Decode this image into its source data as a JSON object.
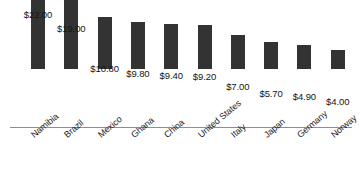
{
  "chart_data": {
    "type": "bar",
    "title": "",
    "xlabel": "",
    "ylabel": "",
    "ylim": [
      0,
      22
    ],
    "grid": false,
    "legend": null,
    "bar_color": "#333333",
    "axis_color": "#8e8e8e",
    "categories": [
      "Namibia",
      "Brazil",
      "Mexico",
      "Ghana",
      "China",
      "United States",
      "Italy",
      "Japan",
      "Germany",
      "Norway"
    ],
    "values": [
      22.0,
      19.0,
      10.8,
      9.8,
      9.4,
      9.2,
      7.0,
      5.7,
      4.9,
      4.0
    ],
    "value_labels": [
      "$22.00",
      "$19.00",
      "$10.80",
      "$9.80",
      "$9.40",
      "$9.20",
      "$7.00",
      "$5.70",
      "$4.90",
      "$4.00"
    ]
  }
}
